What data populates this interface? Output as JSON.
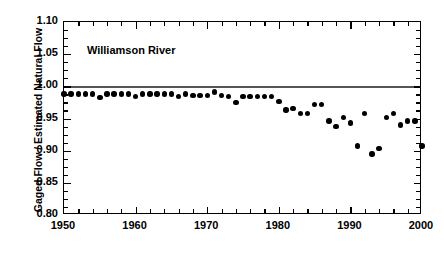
{
  "chart_data": {
    "type": "scatter",
    "title": "",
    "annotation": "Williamson River",
    "xlabel": "",
    "ylabel": "Gaged Flow / Estimated Natural Flow",
    "xlim": [
      1950,
      2000
    ],
    "ylim": [
      0.8,
      1.1
    ],
    "grid": false,
    "legend": false,
    "x_major_ticks": [
      1950,
      1960,
      1970,
      1980,
      1990,
      2000
    ],
    "x_tick_labels": [
      "1950",
      "1960",
      "1970",
      "1980",
      "1990",
      "2000"
    ],
    "x_minor_interval": 2,
    "y_major_ticks": [
      0.8,
      0.85,
      0.9,
      0.95,
      1.0,
      1.05,
      1.1
    ],
    "y_tick_labels": [
      "0.80",
      "0.85",
      "0.90",
      "0.95",
      "1.00",
      "1.05",
      "1.10"
    ],
    "y_minor_interval": 0.0125,
    "reference_line": {
      "value": 1.0,
      "color": "#555555",
      "label": ""
    },
    "marker": {
      "shape": "circle",
      "color": "#000000",
      "size": 5.4
    },
    "x": [
      1950,
      1951,
      1952,
      1953,
      1954,
      1955,
      1956,
      1957,
      1958,
      1959,
      1960,
      1961,
      1962,
      1963,
      1964,
      1965,
      1966,
      1967,
      1968,
      1969,
      1970,
      1971,
      1972,
      1973,
      1974,
      1975,
      1976,
      1977,
      1978,
      1979,
      1980,
      1981,
      1982,
      1983,
      1984,
      1985,
      1986,
      1987,
      1988,
      1989,
      1990,
      1991,
      1992,
      1993,
      1994,
      1995,
      1996,
      1997,
      1998,
      1999,
      2000
    ],
    "values": [
      0.988,
      0.988,
      0.988,
      0.988,
      0.988,
      0.983,
      0.988,
      0.988,
      0.988,
      0.988,
      0.984,
      0.988,
      0.988,
      0.988,
      0.988,
      0.988,
      0.984,
      0.988,
      0.986,
      0.986,
      0.986,
      0.991,
      0.986,
      0.984,
      0.975,
      0.984,
      0.984,
      0.984,
      0.984,
      0.984,
      0.976,
      0.963,
      0.966,
      0.958,
      0.958,
      0.972,
      0.972,
      0.946,
      0.938,
      0.952,
      0.943,
      0.907,
      0.958,
      0.895,
      0.903,
      0.952,
      0.958,
      0.94,
      0.946,
      0.946,
      0.907
    ],
    "series_name": "Gaged / Natural flow ratio"
  },
  "axes": {
    "y_title": "Gaged Flow / Estimated Natural Flow"
  }
}
